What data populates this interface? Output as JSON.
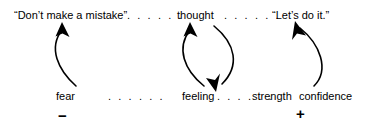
{
  "diagram": {
    "type": "causal-loop",
    "top_row": [
      {
        "name": "quote-dont-make-mistake",
        "text": "“Don’t make a mistake”",
        "x": 14,
        "y": 10
      },
      {
        "name": "node-thought",
        "text": "thought",
        "x": 177,
        "y": 10
      },
      {
        "name": "quote-lets-do-it",
        "text": "“Let’s do it.”",
        "x": 272,
        "y": 10
      }
    ],
    "bottom_row": [
      {
        "name": "node-fear",
        "text": "fear",
        "x": 56,
        "y": 91
      },
      {
        "name": "node-feeling",
        "text": "feeling",
        "x": 182,
        "y": 91
      },
      {
        "name": "node-strength",
        "text": "strength",
        "x": 252,
        "y": 91
      },
      {
        "name": "node-confidence",
        "text": "confidence",
        "x": 299,
        "y": 91
      }
    ],
    "dotted_connectors": [
      {
        "name": "dots-top-left",
        "text": ". . . . . .",
        "x": 127,
        "y": 10
      },
      {
        "name": "dots-top-right",
        "text": ". . . . . .",
        "x": 224,
        "y": 10
      },
      {
        "name": "dots-bottom-left",
        "text": ". . . . . .",
        "x": 108,
        "y": 91
      },
      {
        "name": "dots-bottom-middle",
        "text": ". . . . . .",
        "x": 217,
        "y": 91
      }
    ],
    "polarity_signs": [
      {
        "name": "minus-sign",
        "text": "−",
        "x": 58,
        "y": 108
      },
      {
        "name": "plus-sign",
        "text": "+",
        "x": 296,
        "y": 106
      }
    ],
    "arrows": [
      {
        "name": "arrow-fear-to-quote",
        "from": "fear",
        "to": "“Don’t make a mistake”",
        "direction": "up",
        "bow": "left",
        "path": "M 76 86 C 58 70 48 48 62 30"
      },
      {
        "name": "arrow-feeling-to-thought",
        "from": "feeling",
        "to": "thought",
        "direction": "up",
        "bow": "left",
        "path": "M 204 86 C 184 70 176 48 190 30"
      },
      {
        "name": "arrow-thought-to-feeling",
        "from": "thought",
        "to": "feeling",
        "direction": "down",
        "bow": "right",
        "path": "M 214 26 C 236 44 240 66 222 84"
      },
      {
        "name": "arrow-confidence-to-quote",
        "from": "confidence",
        "to": "“Let’s do it.”",
        "direction": "up",
        "bow": "right",
        "path": "M 314 86 C 330 70 320 44 300 28"
      }
    ],
    "stroke_color": "#000000"
  }
}
